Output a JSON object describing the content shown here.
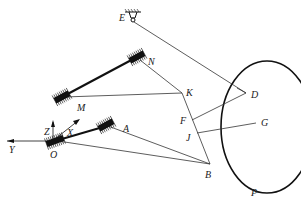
{
  "diagram": {
    "type": "mechanism-linkage",
    "labels": {
      "E": "E",
      "N": "N",
      "M": "M",
      "K": "K",
      "D": "D",
      "F": "F",
      "J": "J",
      "G": "G",
      "A": "A",
      "B": "B",
      "O": "O",
      "P": "P",
      "X": "X",
      "Y": "Y",
      "Z": "Z"
    },
    "points": {
      "E": [
        133,
        20
      ],
      "N": [
        137,
        57
      ],
      "M": [
        62,
        97
      ],
      "K": [
        182,
        93
      ],
      "D": [
        246,
        93
      ],
      "F": [
        192,
        120
      ],
      "J": [
        197,
        133
      ],
      "G": [
        256,
        123
      ],
      "A": [
        103,
        127
      ],
      "B": [
        210,
        164
      ],
      "O": [
        55,
        141
      ]
    },
    "links": [
      [
        "E",
        "D"
      ],
      [
        "N",
        "K"
      ],
      [
        "M",
        "K"
      ],
      [
        "K",
        "B"
      ],
      [
        "F",
        "D"
      ],
      [
        "J",
        "G"
      ],
      [
        "A",
        "B"
      ],
      [
        "O",
        "B"
      ]
    ],
    "rigid_bars": [
      [
        "M",
        "N"
      ],
      [
        "O",
        "A"
      ]
    ],
    "ellipse": {
      "cx": 267,
      "cy": 127,
      "rx": 46,
      "ry": 66,
      "label": "P"
    },
    "axes": {
      "x_label": "X",
      "y_label": "Y",
      "z_label": "Z"
    }
  }
}
